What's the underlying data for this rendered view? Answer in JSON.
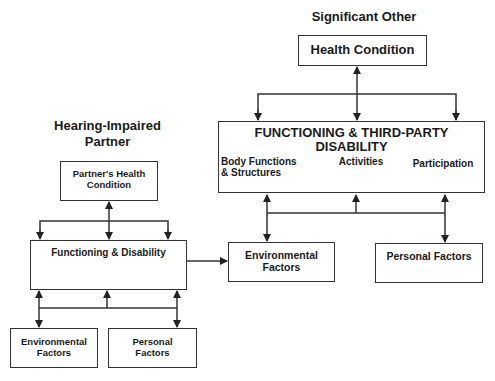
{
  "significant_other": {
    "heading": "Significant Other",
    "health_condition": "Health Condition",
    "functioning_box": {
      "title_line1": "FUNCTIONING & THIRD-PARTY",
      "title_line2": "DISABILITY",
      "components": [
        "Body Functions & Structures",
        "Activities",
        "Participation"
      ]
    },
    "environmental_factors": "Environmental Factors",
    "personal_factors": "Personal Factors"
  },
  "hearing_impaired_partner": {
    "heading_line1": "Hearing-Impaired",
    "heading_line2": "Partner",
    "health_condition_line1": "Partner's Health",
    "health_condition_line2": "Condition",
    "functioning": "Functioning & Disability",
    "environmental_line1": "Environmental",
    "environmental_line2": "Factors",
    "personal_line1": "Personal",
    "personal_line2": "Factors"
  },
  "colors": {
    "line": "#333333",
    "text": "#1a1a1a",
    "background": "#ffffff"
  }
}
